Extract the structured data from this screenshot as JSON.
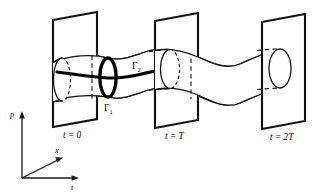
{
  "figure": {
    "domain": "Diagram",
    "background_color": "#ffffff",
    "ink_color": "#111111"
  },
  "planes": [
    {
      "id": "plane-t0",
      "label": "t = 0",
      "time_value": "0"
    },
    {
      "id": "plane-tT",
      "label": "t = T",
      "time_value": "T"
    },
    {
      "id": "plane-t2T",
      "label": "t = 2T",
      "time_value": "2T"
    }
  ],
  "curves": [
    {
      "id": "gamma-1",
      "label": "Γ",
      "subscript": "1",
      "style": "bold-loop"
    },
    {
      "id": "gamma-2",
      "label": "Γ",
      "subscript": "2",
      "style": "bold-loop"
    }
  ],
  "axes": [
    {
      "id": "axis-p",
      "label": "p",
      "direction": "up"
    },
    {
      "id": "axis-x",
      "label": "x",
      "direction": "diagonal-up-right"
    },
    {
      "id": "axis-t",
      "label": "t",
      "direction": "right"
    }
  ],
  "axis_origin": {
    "x": 22,
    "y": 178
  }
}
